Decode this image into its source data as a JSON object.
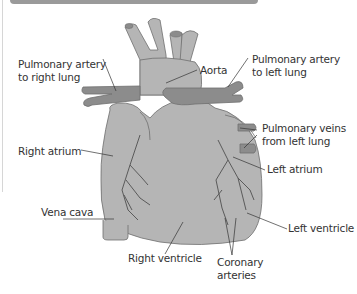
{
  "labels": {
    "pulmonary_artery_right": [
      "Pulmonary artery",
      "to right lung"
    ],
    "aorta": "Aorta",
    "pulmonary_artery_left": [
      "Pulmonary artery",
      "to left lung"
    ],
    "right_atrium": "Right atrium",
    "pulmonary_veins": [
      "Pulmonary veins",
      "from left lung"
    ],
    "left_atrium": "Left atrium",
    "vena_cava": "Vena cava",
    "left_ventricle": "Left ventricle",
    "right_ventricle": "Right ventricle",
    "coronary_arteries": [
      "Coronary",
      "arteries"
    ]
  },
  "colors": {
    "heart_fill": "#b5b5b5",
    "vessel_dark": "#8c8c8c",
    "outline": "#6e6e6e",
    "leader_line": "#333333",
    "text": "#333333",
    "top_bar": "#9a9a9a"
  }
}
